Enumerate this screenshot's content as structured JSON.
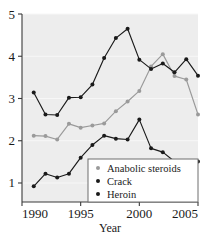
{
  "chart_data": {
    "type": "line",
    "title": "",
    "xlabel": "Year",
    "ylabel": "",
    "xlim": [
      1990,
      2005
    ],
    "ylim": [
      0.55,
      5
    ],
    "grid": true,
    "legend_position": "bottom-right",
    "x": [
      1991,
      1992,
      1993,
      1994,
      1995,
      1996,
      1997,
      1998,
      1999,
      2000,
      2001,
      2002,
      2003,
      2004,
      2005
    ],
    "xticks": [
      1990,
      1995,
      2000,
      2005
    ],
    "xticklabels": [
      "1990",
      "1995",
      "2000",
      "2005"
    ],
    "yticks": [
      1,
      2,
      3,
      4,
      5
    ],
    "yticklabels": [
      "1",
      "2",
      "3",
      "4",
      "5"
    ],
    "series": [
      {
        "name": "Anabolic steroids",
        "color": "#9a9a9a",
        "marker": "circle",
        "values": [
          2.12,
          2.11,
          2.03,
          2.4,
          2.31,
          2.36,
          2.41,
          2.7,
          2.93,
          3.18,
          3.76,
          4.05,
          3.53,
          3.45,
          2.62
        ]
      },
      {
        "name": "Crack",
        "color": "#1a1a1a",
        "marker": "circle",
        "values": [
          3.14,
          2.62,
          2.61,
          3.02,
          3.03,
          3.33,
          3.96,
          4.43,
          4.65,
          3.92,
          3.7,
          3.83,
          3.62,
          3.93,
          3.54
        ]
      },
      {
        "name": "Heroin",
        "color": "#1a1a1a",
        "marker": "circle",
        "values": [
          0.92,
          1.22,
          1.13,
          1.22,
          1.6,
          1.9,
          2.12,
          2.05,
          2.03,
          2.5,
          1.82,
          1.73,
          1.51,
          1.51,
          1.51
        ]
      }
    ]
  },
  "figure": {
    "plot_background": "#ededed",
    "gridline_color": "#f7f7f7",
    "axis_color": "#3a3a3a",
    "legend_border_color": "#6e6e6e",
    "legend_background": "#ffffff"
  },
  "legend": {
    "items": [
      {
        "label": "Anabolic steroids",
        "color": "#9a9a9a"
      },
      {
        "label": "Crack",
        "color": "#1a1a1a"
      },
      {
        "label": "Heroin",
        "color": "#1a1a1a"
      }
    ]
  }
}
